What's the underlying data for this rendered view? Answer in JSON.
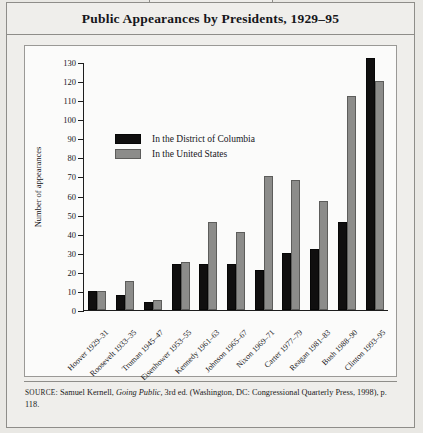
{
  "figure_tab": "FIGURE 4-3",
  "title": "Public Appearances by Presidents, 1929–95",
  "legend": {
    "series": [
      {
        "key": "dc",
        "label": "In the District of Columbia",
        "color": "#100f0f"
      },
      {
        "key": "us",
        "label": "In the United States",
        "color": "#8c8c8a"
      }
    ]
  },
  "source": {
    "prefix": "SOURCE",
    "text_before_italic": ": Samuel Kernell, ",
    "italic": "Going Public,",
    "text_after_italic": " 3rd ed. (Washington, DC: Congressional Quarterly Press, 1998), p. 118."
  },
  "chart_data": {
    "type": "bar",
    "title": "Public Appearances by Presidents, 1929–95",
    "xlabel": "",
    "ylabel": "Number of appearances",
    "ylim": [
      0,
      130
    ],
    "yticks": [
      0,
      10,
      20,
      30,
      40,
      50,
      60,
      70,
      80,
      90,
      100,
      110,
      120,
      130
    ],
    "grid": false,
    "legend_position": "upper-left-inside",
    "categories": [
      "Hoover 1929–31",
      "Roosevelt 1933–35",
      "Truman 1945–47",
      "Eisenhower 1953–55",
      "Kennedy 1961–63",
      "Johnson 1965–67",
      "Nixon 1969–71",
      "Carter 1977–79",
      "Reagan 1981–83",
      "Bush 1988–90",
      "Clinton 1993–95"
    ],
    "series": [
      {
        "name": "In the District of Columbia",
        "color": "#100f0f",
        "values": [
          10,
          8,
          4,
          24,
          24,
          24,
          21,
          30,
          32,
          46,
          132
        ]
      },
      {
        "name": "In the United States",
        "color": "#8c8c8a",
        "values": [
          10,
          15,
          5,
          25,
          46,
          41,
          70,
          68,
          57,
          112,
          120
        ]
      }
    ]
  }
}
